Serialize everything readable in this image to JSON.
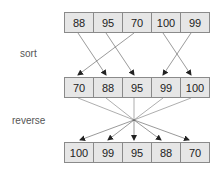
{
  "diagram": {
    "rows": [
      {
        "name": "original",
        "values": [
          "88",
          "95",
          "70",
          "100",
          "99"
        ]
      },
      {
        "name": "sorted",
        "values": [
          "70",
          "88",
          "95",
          "99",
          "100"
        ]
      },
      {
        "name": "reversed",
        "values": [
          "100",
          "99",
          "95",
          "88",
          "70"
        ]
      }
    ],
    "labels": {
      "sort": "sort",
      "reverse": "reverse"
    }
  }
}
